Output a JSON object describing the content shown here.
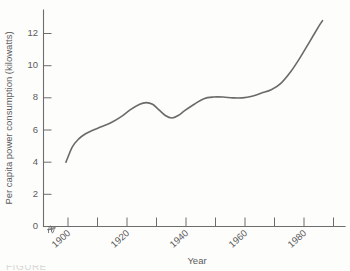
{
  "chart_data": {
    "type": "line",
    "title": "",
    "xlabel": "Year",
    "ylabel": "Per capita power consumption  (kilowatts)",
    "xlim": [
      1890,
      1984
    ],
    "ylim": [
      0,
      13.6
    ],
    "grid": false,
    "legend": null,
    "axis_break": true,
    "x_major_ticks": [
      1900,
      1920,
      1940,
      1960,
      1980
    ],
    "x_major_tick_labels": [
      "1900",
      "1920",
      "1940",
      "1960",
      "1980"
    ],
    "x_minor_ticks": [
      1910,
      1930,
      1950,
      1970
    ],
    "y_ticks": [
      0,
      2,
      4,
      6,
      8,
      10,
      12
    ],
    "y_tick_labels": [
      "0",
      "2",
      "4",
      "6",
      "8",
      "10",
      "12"
    ],
    "series": [
      {
        "name": "Per capita power consumption",
        "color": "#6a6a6a",
        "x": [
          1897,
          1899,
          1901,
          1903,
          1905,
          1908,
          1911,
          1914,
          1917,
          1920,
          1922,
          1924,
          1926,
          1928,
          1930,
          1932,
          1934,
          1937,
          1940,
          1943,
          1946,
          1949,
          1952,
          1955,
          1958,
          1961,
          1964,
          1967,
          1970,
          1973,
          1976,
          1977
        ],
        "y": [
          4.0,
          4.95,
          5.45,
          5.75,
          5.95,
          6.2,
          6.45,
          6.8,
          7.25,
          7.6,
          7.7,
          7.6,
          7.25,
          6.9,
          6.75,
          6.9,
          7.2,
          7.6,
          7.95,
          8.05,
          8.05,
          8.0,
          8.0,
          8.1,
          8.3,
          8.5,
          8.9,
          9.6,
          10.5,
          11.5,
          12.5,
          12.8
        ]
      }
    ]
  },
  "figure": {
    "caption_partial": "FIGURE"
  }
}
